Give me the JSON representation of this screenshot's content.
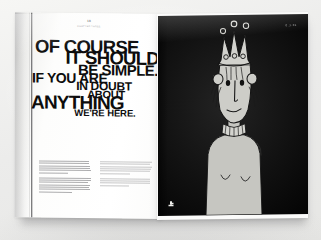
{
  "scene": {
    "description": "photograph of an open book spread on a light gray surface",
    "surface_color": "#ececea"
  },
  "left_page": {
    "background_color": "#ffffff",
    "header": {
      "folio": "18",
      "caption": "CHAPTER THREE"
    },
    "headline": {
      "full_text": "OF COURSE IT SHOULD BE SIMPLE. IF YOU ARE IN DOUBT ABOUT ANYTHING WE'RE HERE.",
      "lines": [
        {
          "text": "OF COURSE",
          "align": "left"
        },
        {
          "text": "IT SHOULD",
          "align": "right"
        },
        {
          "text": "BE SIMPLE.",
          "align": "right"
        },
        {
          "text": "IF YOU ARE",
          "align": "left"
        },
        {
          "text": "IN DOUBT",
          "align": "center"
        },
        {
          "text": "ABOUT",
          "align": "center"
        },
        {
          "text": "ANYTHING",
          "align": "left"
        },
        {
          "text": "WE'RE HERE.",
          "align": "center"
        }
      ],
      "color": "#0d0d0d"
    },
    "body_columns": [
      {
        "paragraph_line_counts": [
          6,
          7
        ]
      },
      {
        "paragraph_line_counts": [
          6,
          4
        ]
      }
    ]
  },
  "right_page": {
    "background_color": "#121212",
    "corner_code": "0.3.01",
    "logo_name": "publisher-logo",
    "illustration": {
      "subject": "figure wearing a three-pointed crown",
      "line_color": "#1a1a1a",
      "fill_color": "#c9c9c4",
      "crown_points": 3,
      "crown_top_jewels": 3,
      "crown_band_jewels": 3,
      "features": [
        "two round eyes",
        "long nose",
        "small smile",
        "ruffled collar",
        "two curved body lines"
      ]
    }
  }
}
